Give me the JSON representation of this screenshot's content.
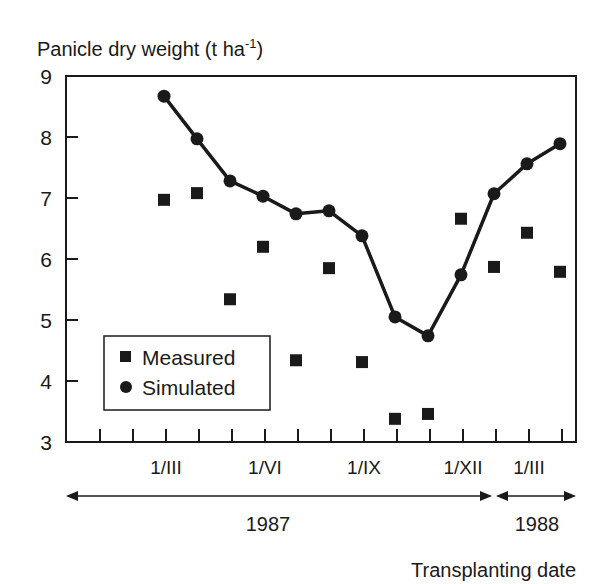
{
  "chart_data": {
    "type": "scatter",
    "title": "",
    "ylabel": "Panicle dry weight (t ha",
    "ylabel_sup": "-1",
    "ylabel_close": ")",
    "xlabel": "Transplanting date",
    "ylim": [
      3,
      9
    ],
    "yticks": [
      "3",
      "4",
      "5",
      "6",
      "7",
      "8",
      "9"
    ],
    "x_month_labels": [
      {
        "label": "1/III",
        "tick_index": 2
      },
      {
        "label": "1/VI",
        "tick_index": 5
      },
      {
        "label": "1/IX",
        "tick_index": 8
      },
      {
        "label": "1/XII",
        "tick_index": 11
      },
      {
        "label": "1/III",
        "tick_index": 13
      }
    ],
    "year_spans": [
      {
        "label": "1987",
        "from_tick": -1,
        "to_tick": 11.75
      },
      {
        "label": "1988",
        "from_tick": 11.75,
        "to_tick": 14.5
      }
    ],
    "grid": false,
    "legend": {
      "position": "lower-left",
      "entries": [
        "Measured",
        "Simulated"
      ]
    },
    "x_index": [
      2,
      3,
      4,
      5,
      6,
      7,
      8,
      9,
      10,
      11,
      12,
      13,
      14
    ],
    "series": [
      {
        "name": "Measured",
        "marker": "square",
        "line": false,
        "values": [
          6.97,
          7.08,
          5.34,
          6.2,
          4.34,
          5.85,
          4.31,
          3.38,
          3.46,
          6.66,
          5.87,
          6.43,
          5.79
        ]
      },
      {
        "name": "Simulated",
        "marker": "circle",
        "line": true,
        "values": [
          8.67,
          7.97,
          7.28,
          7.03,
          6.74,
          6.79,
          6.38,
          5.05,
          4.74,
          5.74,
          7.07,
          7.56,
          7.89
        ]
      }
    ]
  },
  "colors": {
    "ink": "#1a1a1a",
    "background": "#ffffff"
  }
}
